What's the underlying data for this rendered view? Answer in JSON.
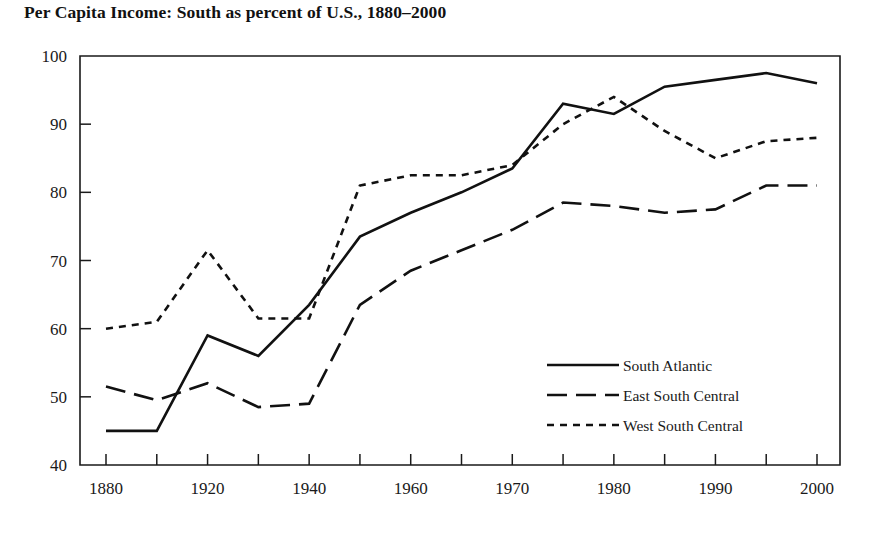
{
  "chart": {
    "title": "Per Capita Income: South as percent of U.S., 1880–2000"
  },
  "axes": {
    "y_tick_labels": [
      "100",
      "90",
      "80",
      "70",
      "60",
      "50",
      "40"
    ],
    "x_tick_labels": [
      "1880",
      "1920",
      "1940",
      "1960",
      "1970",
      "1980",
      "1990",
      "2000"
    ]
  },
  "legend": {
    "items": [
      {
        "label": "South Atlantic",
        "style": "solid"
      },
      {
        "label": "East South Central",
        "style": "long-dash"
      },
      {
        "label": "West South Central",
        "style": "short-dash"
      }
    ]
  },
  "chart_data": {
    "type": "line",
    "title": "Per Capita Income: South as percent of U.S., 1880–2000",
    "xlabel": "",
    "ylabel": "",
    "ylim": [
      40,
      100
    ],
    "grid": false,
    "legend_position": "center-right",
    "x": [
      1880,
      1900,
      1920,
      1930,
      1940,
      1950,
      1960,
      1965,
      1970,
      1975,
      1980,
      1985,
      1990,
      1995,
      2000
    ],
    "x_axis_note": "Ticks are evenly spaced but non-linear in time: 20-year steps to 1920, then 10-year steps to 1950, then 5-year steps to 2000.",
    "xtick_labeled": [
      1880,
      1920,
      1940,
      1960,
      1970,
      1980,
      1990,
      2000
    ],
    "series": [
      {
        "name": "South Atlantic",
        "style": "solid",
        "values": [
          45.0,
          45.0,
          59.0,
          56.0,
          63.5,
          73.5,
          77.0,
          80.0,
          83.5,
          93.0,
          91.5,
          95.5,
          96.5,
          97.5,
          96.0
        ]
      },
      {
        "name": "East South Central",
        "style": "long-dash",
        "values": [
          51.5,
          49.5,
          52.0,
          48.5,
          49.0,
          63.5,
          68.5,
          71.5,
          74.5,
          78.5,
          78.0,
          77.0,
          77.5,
          81.0,
          81.0
        ]
      },
      {
        "name": "West South Central",
        "style": "short-dash",
        "values": [
          60.0,
          61.0,
          71.5,
          61.5,
          61.5,
          81.0,
          82.5,
          82.5,
          84.0,
          90.0,
          94.0,
          89.0,
          85.0,
          87.5,
          88.0
        ]
      }
    ]
  },
  "geometry": {
    "plot_left": 80,
    "plot_right": 840,
    "plot_top": 56,
    "plot_bottom": 465,
    "x_first_tick": 106,
    "x_last_tick": 817
  }
}
